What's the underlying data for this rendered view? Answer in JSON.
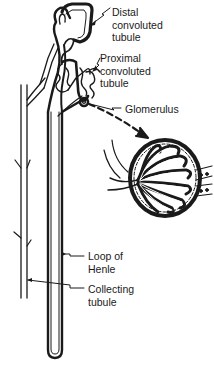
{
  "diagram": {
    "labels": {
      "distal": [
        "Distal",
        "convoluted",
        "tubule"
      ],
      "proximal": [
        "Proximal",
        "convoluted",
        "tubule"
      ],
      "glomerulus": [
        "Glomerulus"
      ],
      "loop": [
        "Loop of",
        "Henle"
      ],
      "collecting": [
        "Collecting",
        "tubule"
      ]
    },
    "colors": {
      "ink": "#1a1a1a",
      "background": "#ffffff"
    }
  }
}
